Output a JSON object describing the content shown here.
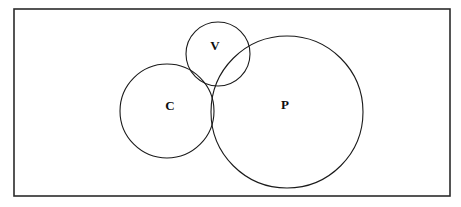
{
  "diagram": {
    "type": "venn-diagram",
    "title": "",
    "canvas": {
      "width": 461,
      "height": 207,
      "background": "#ffffff"
    },
    "universe": {
      "name": "universal-set-rectangle",
      "x": 14,
      "y": 9,
      "width": 436,
      "height": 187,
      "stroke": "#2b2b2b",
      "stroke_width": 1.6,
      "fill": "none",
      "label": ""
    },
    "sets": [
      {
        "id": "V",
        "label": "V",
        "cx": 218,
        "cy": 54,
        "r": 32,
        "label_x": 215,
        "label_y": 47,
        "stroke": "#1a1a1a",
        "stroke_width": 1.1,
        "fill": "none"
      },
      {
        "id": "C",
        "label": "C",
        "cx": 167,
        "cy": 111,
        "r": 47,
        "label_x": 170,
        "label_y": 107,
        "stroke": "#1a1a1a",
        "stroke_width": 1.1,
        "fill": "none"
      },
      {
        "id": "P",
        "label": "P",
        "cx": 287,
        "cy": 112,
        "r": 76,
        "label_x": 285,
        "label_y": 106,
        "stroke": "#1a1a1a",
        "stroke_width": 1.1,
        "fill": "none"
      }
    ],
    "overlaps": [
      {
        "sets": "V,C",
        "label": ""
      },
      {
        "sets": "V,P",
        "label": ""
      },
      {
        "sets": "C,P",
        "label": ""
      },
      {
        "sets": "V,C,P",
        "label": ""
      }
    ]
  }
}
